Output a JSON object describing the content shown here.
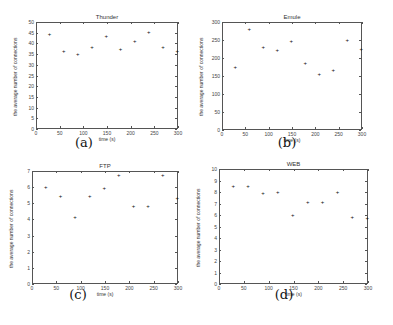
{
  "chart_data": [
    {
      "type": "scatter",
      "title": "Thunder",
      "caption": "(a)",
      "xlabel": "time (s)",
      "ylabel": "the average number of connections",
      "xlim": [
        0,
        300
      ],
      "ylim": [
        0,
        50
      ],
      "xticks": [
        0,
        50,
        100,
        150,
        200,
        250,
        300
      ],
      "yticks": [
        0,
        5,
        10,
        15,
        20,
        25,
        30,
        35,
        40,
        45,
        50
      ],
      "grid": false,
      "x": [
        30,
        60,
        90,
        120,
        150,
        180,
        210,
        240,
        270,
        300
      ],
      "y": [
        44,
        36,
        35,
        38,
        43,
        37,
        41,
        45,
        38,
        36
      ]
    },
    {
      "type": "scatter",
      "title": "Emule",
      "caption": "(b)",
      "xlabel": "time (s)",
      "ylabel": "the average number of connections",
      "xlim": [
        0,
        300
      ],
      "ylim": [
        0,
        300
      ],
      "xticks": [
        0,
        50,
        100,
        150,
        200,
        250,
        300
      ],
      "yticks": [
        0,
        50,
        100,
        150,
        200,
        250,
        300
      ],
      "grid": false,
      "x": [
        30,
        60,
        90,
        120,
        150,
        180,
        210,
        240,
        270,
        300
      ],
      "y": [
        175,
        280,
        230,
        220,
        245,
        185,
        155,
        165,
        250,
        225
      ]
    },
    {
      "type": "scatter",
      "title": "FTP",
      "caption": "(c)",
      "xlabel": "time (s)",
      "ylabel": "the average number of connections",
      "xlim": [
        0,
        300
      ],
      "ylim": [
        0,
        7
      ],
      "xticks": [
        0,
        50,
        100,
        150,
        200,
        250,
        300
      ],
      "yticks": [
        0,
        1,
        2,
        3,
        4,
        5,
        6,
        7
      ],
      "grid": false,
      "x": [
        30,
        60,
        90,
        120,
        150,
        180,
        210,
        240,
        270,
        300
      ],
      "y": [
        6.0,
        5.4,
        4.1,
        5.4,
        5.9,
        6.7,
        4.8,
        4.8,
        6.7,
        5.3
      ]
    },
    {
      "type": "scatter",
      "title": "WEB",
      "caption": "(d)",
      "xlabel": "time (s)",
      "ylabel": "the average number of connections",
      "xlim": [
        0,
        300
      ],
      "ylim": [
        0,
        10
      ],
      "xticks": [
        0,
        50,
        100,
        150,
        200,
        250,
        300
      ],
      "yticks": [
        0,
        1,
        2,
        3,
        4,
        5,
        6,
        7,
        8,
        9,
        10
      ],
      "grid": false,
      "x": [
        30,
        60,
        90,
        120,
        150,
        180,
        210,
        240,
        270,
        300
      ],
      "y": [
        8.5,
        8.5,
        7.9,
        8.0,
        6.0,
        7.1,
        7.1,
        8.0,
        5.8,
        5.7
      ]
    }
  ],
  "layout": {
    "panels": [
      {
        "left": 36,
        "top": 22,
        "width": 142,
        "height": 107,
        "caption_x": 64,
        "caption_y": 143
      },
      {
        "left": 222,
        "top": 22,
        "width": 140,
        "height": 108,
        "caption_x": 267,
        "caption_y": 143
      },
      {
        "left": 32,
        "top": 171,
        "width": 146,
        "height": 113,
        "caption_x": 58,
        "caption_y": 295
      },
      {
        "left": 219,
        "top": 169,
        "width": 149,
        "height": 115,
        "caption_x": 264,
        "caption_y": 295
      }
    ]
  }
}
